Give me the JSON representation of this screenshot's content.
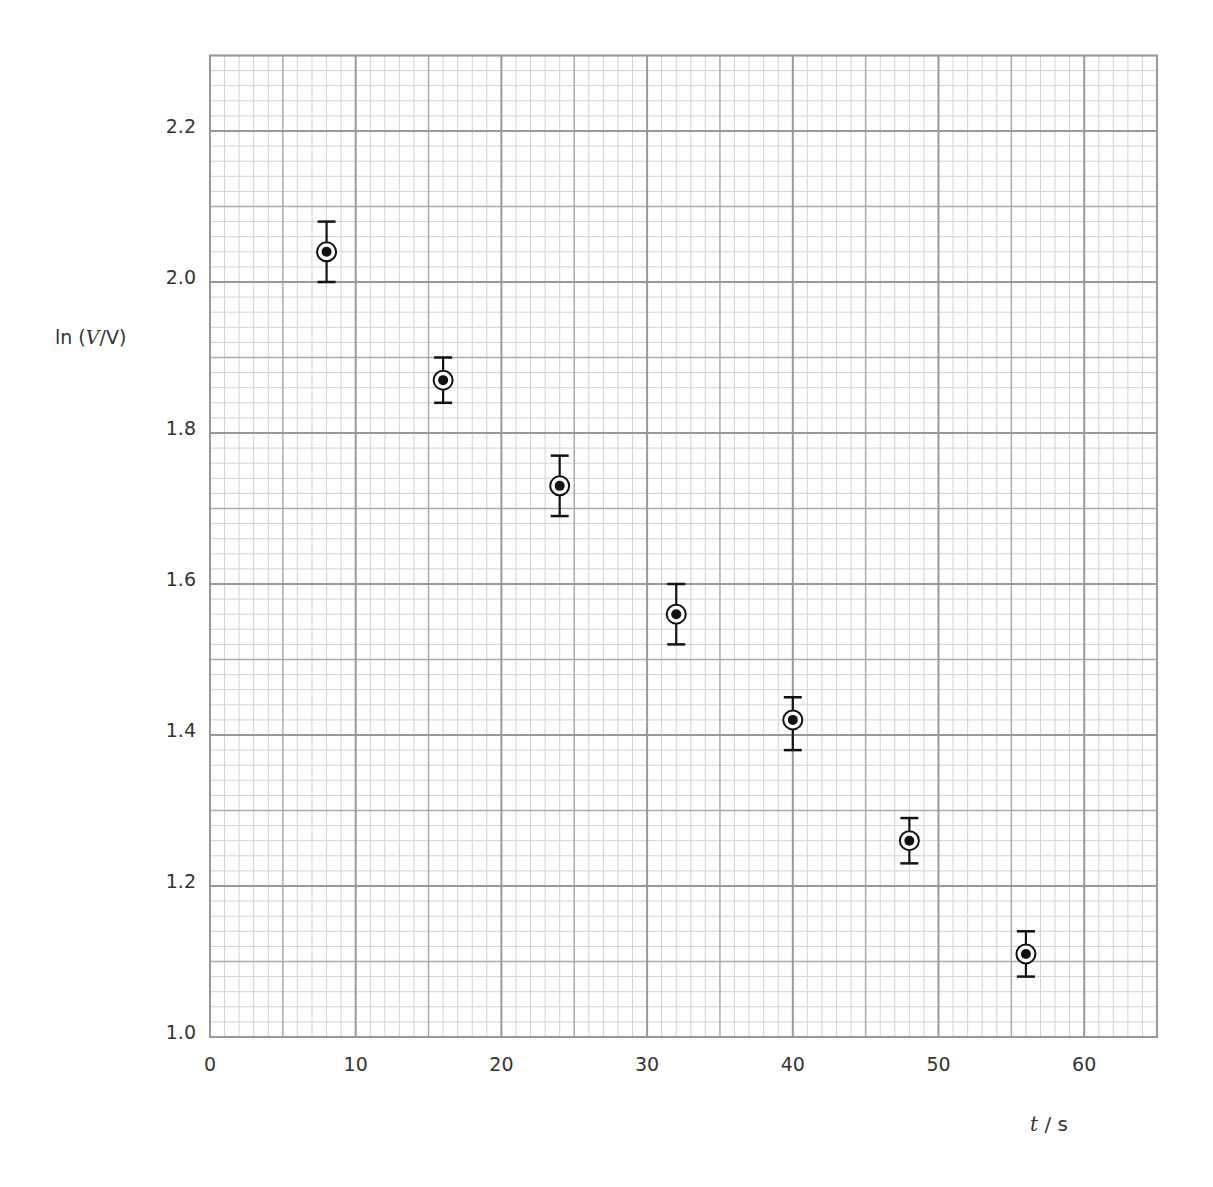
{
  "chart_data": {
    "type": "scatter",
    "title": "",
    "xlabel": "t / s",
    "xlabel_parts": {
      "var": "t",
      "unit": " / s"
    },
    "ylabel": "ln (V/V)",
    "ylabel_parts": {
      "prefix": "ln (",
      "var": "V",
      "suffix": "/V)"
    },
    "xlim": [
      0,
      65
    ],
    "ylim": [
      1.0,
      2.3
    ],
    "grid": true,
    "grid_major": {
      "x": 10,
      "y": 0.2
    },
    "grid_medium": {
      "x": 5,
      "y": 0.1
    },
    "grid_minor": {
      "x": 1,
      "y": 0.02
    },
    "x_ticks": [
      0,
      10,
      20,
      30,
      40,
      50,
      60
    ],
    "x_tick_labels": [
      "0",
      "10",
      "20",
      "30",
      "40",
      "50",
      "60"
    ],
    "y_ticks": [
      1.0,
      1.2,
      1.4,
      1.6,
      1.8,
      2.0,
      2.2
    ],
    "y_tick_labels": [
      "1.0",
      "1.2",
      "1.4",
      "1.6",
      "1.8",
      "2.0",
      "2.2"
    ],
    "legend": null,
    "marker": "circled-dot with vertical error bars",
    "series": [
      {
        "name": "ln(V/V) vs t",
        "points": [
          {
            "x": 8,
            "y": 2.04,
            "y_err_low": 2.0,
            "y_err_high": 2.08
          },
          {
            "x": 16,
            "y": 1.87,
            "y_err_low": 1.84,
            "y_err_high": 1.9
          },
          {
            "x": 24,
            "y": 1.73,
            "y_err_low": 1.69,
            "y_err_high": 1.77
          },
          {
            "x": 32,
            "y": 1.56,
            "y_err_low": 1.52,
            "y_err_high": 1.6
          },
          {
            "x": 40,
            "y": 1.42,
            "y_err_low": 1.38,
            "y_err_high": 1.45
          },
          {
            "x": 48,
            "y": 1.26,
            "y_err_low": 1.23,
            "y_err_high": 1.29
          },
          {
            "x": 56,
            "y": 1.11,
            "y_err_low": 1.08,
            "y_err_high": 1.14
          }
        ]
      }
    ]
  },
  "colors": {
    "grid_major": "#999999",
    "grid_medium": "#aaaaaa",
    "grid_minor": "#d2d2d2",
    "marker": "#111111",
    "text": "#333333"
  }
}
